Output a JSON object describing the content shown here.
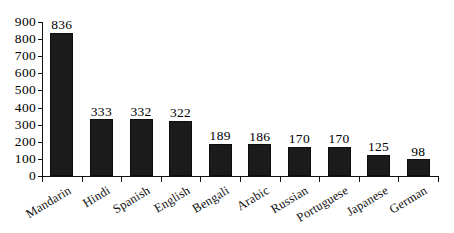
{
  "chart_data": {
    "type": "bar",
    "title": "",
    "subtitle": "",
    "xlabel": "",
    "ylabel": "",
    "categories": [
      "Mandarin",
      "Hindi",
      "Spanish",
      "English",
      "Bengali",
      "Arabic",
      "Russian",
      "Portuguese",
      "Japanese",
      "German"
    ],
    "values": [
      836,
      333,
      332,
      322,
      189,
      186,
      170,
      170,
      125,
      98
    ],
    "value_labels": [
      "836",
      "333",
      "332",
      "322",
      "189",
      "186",
      "170",
      "170",
      "125",
      "98"
    ],
    "ylim": [
      0,
      900
    ],
    "ytick_values": [
      0,
      100,
      200,
      300,
      400,
      500,
      600,
      700,
      800,
      900
    ],
    "ytick_labels": [
      "0",
      "100",
      "200",
      "300",
      "400",
      "500",
      "600",
      "700",
      "800",
      "900"
    ],
    "grid": false,
    "legend": false,
    "legend_position": "none",
    "bar_color": "#1b1b1b",
    "axis_color": "#101010",
    "background_color": "#ffffff",
    "label_rotation_deg": -31
  }
}
